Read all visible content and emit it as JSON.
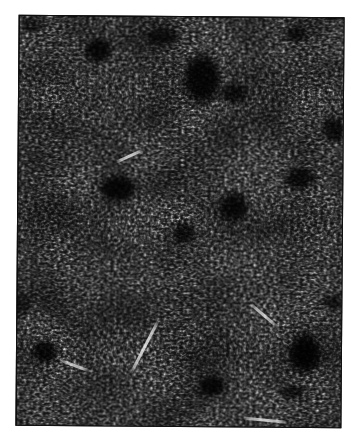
{
  "page": {
    "background": "#ffffff"
  },
  "photo": {
    "description": "Black-and-white halftone photograph of a dense fine-grained speckled texture (lichen / shrub vegetation mat seen from above) with scattered solid-dark irregular gaps and a few pale twig-like streaks, printed on a white page",
    "left": 17,
    "top": 16,
    "width": 326,
    "height": 411,
    "rotation_deg": 0.45,
    "base_color": "#060606",
    "speckle_color": "#e6e6e6",
    "border_color": "#111111",
    "grain": {
      "base_frequency": "0.30 0.42",
      "octaves": 2,
      "seed": 17,
      "gamma_amplitude": 1.3,
      "gamma_exponent": 2.8,
      "gamma_offset": 0.03,
      "low_frequency": "0.018 0.022",
      "low_octaves": 2,
      "low_seed": 4,
      "low_slope": 1.05,
      "low_intercept": 0.28
    },
    "dark_blobs": [
      {
        "cx": 79,
        "cy": 34,
        "rx": 16,
        "ry": 14,
        "opacity": 0.85
      },
      {
        "cx": 143,
        "cy": 20,
        "rx": 20,
        "ry": 11,
        "opacity": 0.7
      },
      {
        "cx": 183,
        "cy": 62,
        "rx": 22,
        "ry": 30,
        "opacity": 0.9
      },
      {
        "cx": 215,
        "cy": 76,
        "rx": 16,
        "ry": 12,
        "opacity": 0.8
      },
      {
        "cx": 276,
        "cy": 16,
        "rx": 13,
        "ry": 9,
        "opacity": 0.7
      },
      {
        "cx": 13,
        "cy": 9,
        "rx": 14,
        "ry": 10,
        "opacity": 0.6
      },
      {
        "cx": 100,
        "cy": 172,
        "rx": 21,
        "ry": 15,
        "opacity": 0.85
      },
      {
        "cx": 216,
        "cy": 189,
        "rx": 17,
        "ry": 17,
        "opacity": 0.8
      },
      {
        "cx": 166,
        "cy": 216,
        "rx": 14,
        "ry": 13,
        "opacity": 0.75
      },
      {
        "cx": 281,
        "cy": 160,
        "rx": 18,
        "ry": 13,
        "opacity": 0.8
      },
      {
        "cx": 315,
        "cy": 112,
        "rx": 13,
        "ry": 15,
        "opacity": 0.8
      },
      {
        "cx": 3,
        "cy": 289,
        "rx": 12,
        "ry": 14,
        "opacity": 0.6
      },
      {
        "cx": 28,
        "cy": 336,
        "rx": 15,
        "ry": 14,
        "opacity": 0.85
      },
      {
        "cx": 288,
        "cy": 336,
        "rx": 18,
        "ry": 23,
        "opacity": 0.9
      },
      {
        "cx": 195,
        "cy": 369,
        "rx": 15,
        "ry": 12,
        "opacity": 0.8
      },
      {
        "cx": 276,
        "cy": 374,
        "rx": 15,
        "ry": 9,
        "opacity": 0.7
      },
      {
        "cx": 315,
        "cy": 284,
        "rx": 12,
        "ry": 9,
        "opacity": 0.7
      }
    ],
    "light_streaks": [
      {
        "cx": 128,
        "cy": 329,
        "length": 62,
        "width": 3,
        "angle_deg": -63,
        "opacity": 0.85
      },
      {
        "cx": 248,
        "cy": 402,
        "length": 45,
        "width": 3,
        "angle_deg": 5,
        "opacity": 0.8
      },
      {
        "cx": 246,
        "cy": 297,
        "length": 35,
        "width": 2.5,
        "angle_deg": 40,
        "opacity": 0.75
      },
      {
        "cx": 111,
        "cy": 139,
        "length": 30,
        "width": 3,
        "angle_deg": -25,
        "opacity": 0.8
      },
      {
        "cx": 58,
        "cy": 349,
        "length": 30,
        "width": 2.5,
        "angle_deg": 20,
        "opacity": 0.75
      }
    ]
  }
}
